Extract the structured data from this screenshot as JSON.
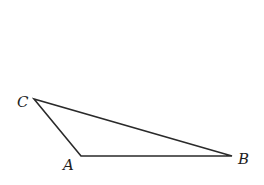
{
  "figure": {
    "type": "triangle",
    "stroke_color": "#2a2a2a",
    "background": "#ffffff",
    "vertices": [
      {
        "name": "C",
        "x": 34,
        "y": 99
      },
      {
        "name": "A",
        "x": 81,
        "y": 156
      },
      {
        "name": "B",
        "x": 232,
        "y": 156
      }
    ],
    "labels": {
      "C": "C",
      "A": "A",
      "B": "B"
    }
  }
}
